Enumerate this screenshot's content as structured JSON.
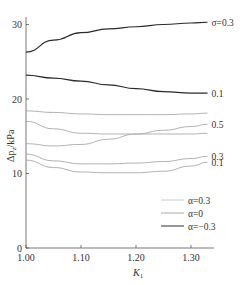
{
  "chart_data": {
    "type": "line",
    "title": "",
    "xlabel": "K1",
    "ylabel": "Δp_z/kPa",
    "xlim": [
      1.0,
      1.335
    ],
    "ylim": [
      0,
      31
    ],
    "x_ticks": [
      "1.00",
      "1.10",
      "1.20",
      "1.30"
    ],
    "y_ticks": [
      "0",
      "10",
      "20",
      "30"
    ],
    "grid": false,
    "legend_position": "lower right inside",
    "legend": [
      {
        "label": "α=0.3",
        "style": "light"
      },
      {
        "label": "α=0",
        "style": "medium"
      },
      {
        "label": "α=−0.3",
        "style": "dark"
      }
    ],
    "x": [
      1.0,
      1.05,
      1.1,
      1.15,
      1.2,
      1.25,
      1.3,
      1.33
    ],
    "series": [
      {
        "name": "σ=0.3",
        "label": "σ=0.3",
        "color": "#333333",
        "values": [
          26.3,
          27.9,
          28.9,
          29.4,
          29.7,
          30.0,
          30.2,
          30.3
        ]
      },
      {
        "name": "σ=0.1 (dark)",
        "label": "0.1",
        "color": "#333333",
        "values": [
          23.2,
          22.8,
          22.4,
          21.9,
          21.4,
          21.0,
          20.8,
          20.8
        ]
      },
      {
        "name": "upper light",
        "label": "",
        "color": "#aaaaaa",
        "values": [
          18.4,
          18.2,
          18.0,
          17.9,
          17.9,
          17.9,
          18.0,
          18.1
        ]
      },
      {
        "name": "descending light",
        "label": "",
        "color": "#aaaaaa",
        "values": [
          17.0,
          16.0,
          15.4,
          15.3,
          15.3,
          15.3,
          15.3,
          15.4
        ]
      },
      {
        "name": "0.5",
        "label": "0.5",
        "color": "#aaaaaa",
        "values": [
          14.0,
          13.7,
          13.9,
          14.6,
          15.3,
          15.8,
          16.3,
          16.6
        ]
      },
      {
        "name": "0.3",
        "label": "0.3",
        "color": "#aaaaaa",
        "values": [
          12.6,
          11.7,
          11.3,
          11.3,
          11.4,
          11.6,
          12.0,
          12.3
        ]
      },
      {
        "name": "0.1 (light)",
        "label": "0.1",
        "color": "#aaaaaa",
        "values": [
          11.8,
          10.8,
          10.2,
          10.1,
          10.1,
          10.3,
          11.0,
          11.5
        ]
      }
    ]
  },
  "axes": {
    "xlabel_main": "K",
    "xlabel_sub": "1",
    "ylabel": "Δp",
    "ylabel_sub": "z",
    "ylabel_unit": "/kPa"
  }
}
